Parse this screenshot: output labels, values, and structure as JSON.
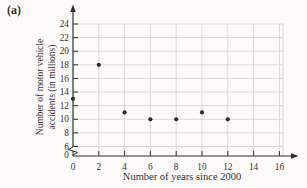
{
  "figure": {
    "panel_label": "(a)"
  },
  "chart_data": {
    "type": "scatter",
    "title": "",
    "xlabel": "Number of years since 2000",
    "ylabel": "Number of motor vehicle accidents (in millions)",
    "ylabel_lines": [
      "Number of motor vehicle",
      "accidents (in millions)"
    ],
    "points": [
      [
        0,
        13
      ],
      [
        2,
        18
      ],
      [
        4,
        11
      ],
      [
        6,
        10
      ],
      [
        8,
        10
      ],
      [
        10,
        11
      ],
      [
        12,
        10
      ]
    ],
    "x_ticks": [
      0,
      2,
      4,
      6,
      8,
      10,
      12,
      14,
      16
    ],
    "y_ticks": [
      0,
      6,
      8,
      10,
      12,
      14,
      16,
      18,
      20,
      22,
      24
    ],
    "xlim": [
      0,
      17
    ],
    "ylim": [
      0,
      25
    ],
    "y_axis_break_between": [
      0,
      6
    ],
    "grid": true,
    "legend": "none",
    "marker": "filled-circle",
    "colors": {
      "background": "#fcfbf9",
      "axis": "#2f2f2f",
      "grid": "#cfcecc",
      "point": "#2b2b2b",
      "text": "#333333"
    }
  }
}
